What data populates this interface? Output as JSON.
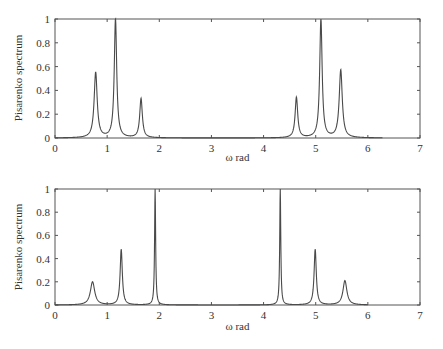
{
  "chart_data": [
    {
      "type": "line",
      "title": "",
      "xlabel": "ω rad",
      "ylabel": "Pisarenko spectrum",
      "xlim": [
        0,
        7
      ],
      "ylim": [
        0,
        1
      ],
      "xticks": [
        0,
        1,
        2,
        3,
        4,
        5,
        6,
        7
      ],
      "yticks": [
        0,
        0.2,
        0.4,
        0.6,
        0.8,
        1
      ],
      "ytick_labels": [
        "0",
        "0.2",
        "0.4",
        "0.6",
        "0.8",
        "1"
      ],
      "grid": false,
      "curve_x_range": [
        0,
        6.28
      ],
      "peaks": [
        {
          "omega": 0.78,
          "value": 0.55,
          "width": 0.035
        },
        {
          "omega": 1.16,
          "value": 1.0,
          "width": 0.028
        },
        {
          "omega": 1.65,
          "value": 0.33,
          "width": 0.03
        },
        {
          "omega": 4.63,
          "value": 0.34,
          "width": 0.03
        },
        {
          "omega": 5.1,
          "value": 1.0,
          "width": 0.028
        },
        {
          "omega": 5.48,
          "value": 0.57,
          "width": 0.035
        }
      ]
    },
    {
      "type": "line",
      "title": "",
      "xlabel": "ω rad",
      "ylabel": "Pisarenko spectrum",
      "xlim": [
        0,
        7
      ],
      "ylim": [
        0,
        1
      ],
      "xticks": [
        0,
        1,
        2,
        3,
        4,
        5,
        6,
        7
      ],
      "yticks": [
        0,
        0.2,
        0.4,
        0.6,
        0.8,
        1
      ],
      "ytick_labels": [
        "0",
        "0.2",
        "0.4",
        "0.6",
        "0.8",
        "1"
      ],
      "grid": false,
      "curve_x_range": [
        0,
        6.0
      ],
      "peaks": [
        {
          "omega": 0.72,
          "value": 0.2,
          "width": 0.05
        },
        {
          "omega": 1.27,
          "value": 0.48,
          "width": 0.025
        },
        {
          "omega": 1.92,
          "value": 1.0,
          "width": 0.012
        },
        {
          "omega": 4.32,
          "value": 1.0,
          "width": 0.012
        },
        {
          "omega": 4.99,
          "value": 0.48,
          "width": 0.025
        },
        {
          "omega": 5.56,
          "value": 0.21,
          "width": 0.045
        }
      ]
    }
  ],
  "colors": {
    "line": "#4a4a4a",
    "axis": "#555555",
    "text": "#333333"
  }
}
